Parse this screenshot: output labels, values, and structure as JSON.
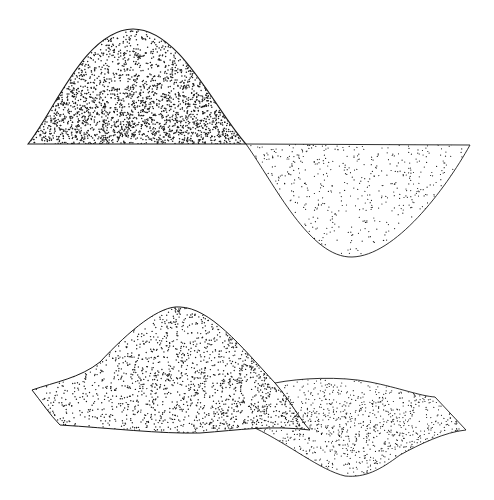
{
  "illustration": {
    "background": "#ffffff",
    "ink": "#1a1a1a",
    "figures": [
      {
        "id": "sine-wave-2d",
        "description": "Stippled 2D sine wave: dark positive lobe above baseline, light negative lobe below",
        "baseline_y": 144,
        "x_start": 28,
        "x_end": 470,
        "positive_lobe": {
          "path": "M28,144 C55,110 85,30 133,29 C180,29 215,110 246,144 Z",
          "dot_count": 3200,
          "dot_radius": 0.75,
          "dark_bias": "bottom",
          "bbox": [
            28,
            29,
            246,
            144
          ]
        },
        "negative_lobe": {
          "path": "M246,144 C275,185 310,258 352,257 C395,256 445,190 470,145 Z",
          "dot_count": 700,
          "dot_radius": 0.6,
          "dark_bias": "top",
          "bbox": [
            246,
            144,
            470,
            257
          ]
        }
      },
      {
        "id": "wave-surface-3d",
        "description": "Stippled twisted 3D wave surface (ribbon) shown in perspective",
        "front_band": {
          "path": "M32,390 C55,382 80,378 100,362 C130,330 160,305 180,307 C210,308 240,345 275,383 C290,400 300,420 310,430 C270,425 240,430 200,433 C160,434 110,428 60,425 C50,415 40,400 32,390 Z",
          "dot_count": 2600,
          "dot_radius": 0.7,
          "dark_bias": "right",
          "bbox": [
            32,
            305,
            310,
            435
          ]
        },
        "back_band": {
          "path": "M275,383 C300,378 340,376 370,382 C400,388 420,396 435,397 L466,430 C445,432 420,444 400,455 C380,470 365,478 345,476 C320,470 290,445 255,428 C270,418 280,400 275,383 Z",
          "dot_count": 1400,
          "dot_radius": 0.6,
          "dark_bias": "center",
          "bbox": [
            255,
            376,
            466,
            478
          ]
        }
      }
    ]
  }
}
